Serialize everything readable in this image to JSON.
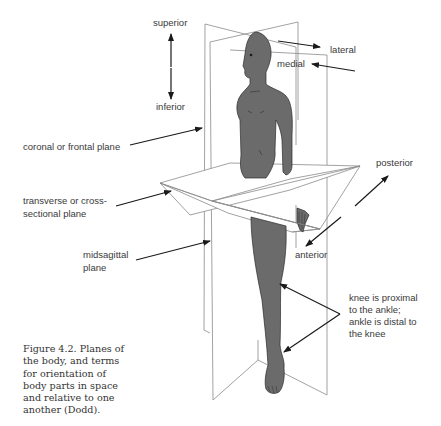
{
  "figure": {
    "caption": "Figure 4.2. Planes of\nthe body, and terms\nfor orientation of\nbody parts in space\nand relative to one\nanother (Dodd).",
    "colors": {
      "body_fill": "#6b6b6b",
      "plane_line": "#8a8a8a",
      "arrow": "#1a1a1a",
      "text": "#3a3a3a"
    }
  },
  "labels": {
    "superior": "superior",
    "inferior": "inferior",
    "lateral": "lateral",
    "medial": "medial",
    "coronal_plane": "coronal or frontal plane",
    "transverse_plane_line1": "transverse or cross-",
    "transverse_plane_line2": "sectional plane",
    "midsagittal_line1": "midsagittal",
    "midsagittal_line2": "plane",
    "posterior": "posterior",
    "anterior": "anterior",
    "proximal_distal_line1": "knee is proximal",
    "proximal_distal_line2": "to the ankle;",
    "proximal_distal_line3": "ankle is distal to",
    "proximal_distal_line4": "the knee"
  }
}
